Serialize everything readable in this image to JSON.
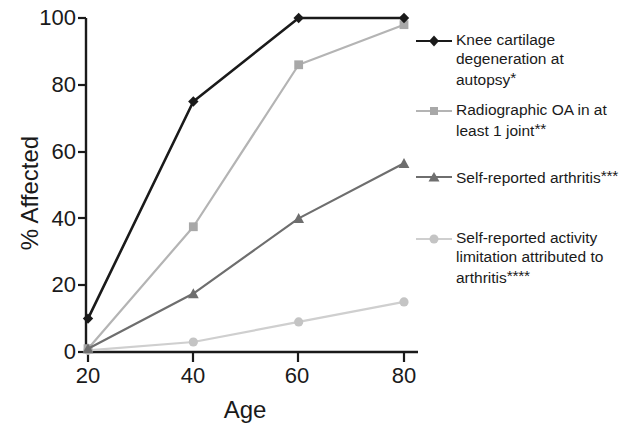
{
  "chart_data": {
    "type": "line",
    "title": "",
    "subtitle": "",
    "xlabel": "Age",
    "ylabel": "% Affected",
    "x": [
      20,
      40,
      60,
      80
    ],
    "xtick_labels": [
      "20",
      "40",
      "60",
      "80"
    ],
    "ytick_labels": [
      "0",
      "20",
      "40",
      "60",
      "80",
      "100"
    ],
    "ytick_values": [
      0,
      20,
      40,
      60,
      80,
      100
    ],
    "xlim": [
      20,
      80
    ],
    "ylim": [
      0,
      100
    ],
    "grid": false,
    "legend_position": "right",
    "series": [
      {
        "name": "Knee cartilage degeneration at autopsy*",
        "label_lines": [
          "Knee cartilage",
          "degeneration at autopsy*"
        ],
        "footnote_marks": "*",
        "marker": "diamond",
        "color": "#1a1a1a",
        "values": [
          10,
          75,
          100,
          100
        ]
      },
      {
        "name": "Radiographic OA in at least 1 joint**",
        "label_lines": [
          "Radiographic OA in at",
          "least 1 joint**"
        ],
        "footnote_marks": "**",
        "marker": "square",
        "color": "#b4b4b4",
        "values": [
          1,
          37.5,
          86,
          98
        ]
      },
      {
        "name": "Self-reported arthritis***",
        "label_lines": [
          "Self-reported arthritis***"
        ],
        "footnote_marks": "***",
        "marker": "triangle",
        "color": "#6e6e6e",
        "values": [
          1,
          17.5,
          40,
          56.5
        ]
      },
      {
        "name": "Self-reported activity limitation attributed to arthritis****",
        "label_lines": [
          "Self-reported activity",
          "limitation attributed to",
          "arthritis****"
        ],
        "footnote_marks": "****",
        "marker": "circle",
        "color": "#cfcfcf",
        "values": [
          0.5,
          3,
          9,
          15
        ]
      }
    ]
  },
  "legend": {
    "items": [
      {
        "line1": "Knee cartilage",
        "line2": "degeneration at autopsy",
        "line3": "",
        "marks": "*"
      },
      {
        "line1": "Radiographic OA in at",
        "line2": "least 1 joint",
        "line3": "",
        "marks": "**"
      },
      {
        "line1": "Self-reported arthritis",
        "line2": "",
        "line3": "",
        "marks": "***"
      },
      {
        "line1": "Self-reported activity",
        "line2": "limitation attributed to",
        "line3": "arthritis",
        "marks": "****"
      }
    ]
  },
  "axes": {
    "ylabel": "% Affected",
    "xlabel": "Age",
    "yticks": [
      "100",
      "80",
      "60",
      "40",
      "20",
      "0"
    ],
    "xticks": [
      "20",
      "40",
      "60",
      "80"
    ]
  }
}
